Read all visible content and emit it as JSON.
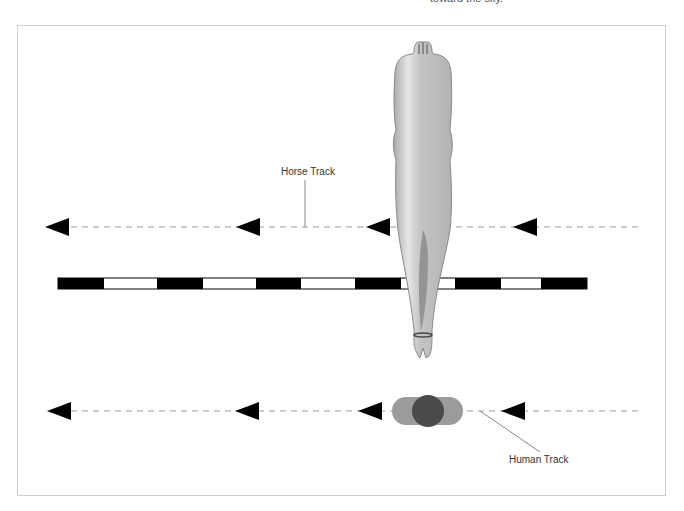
{
  "caption_fragment": "toward the sky.",
  "labels": {
    "horse_track": "Horse Track",
    "human_track": "Human Track"
  },
  "colors": {
    "frame": "#cfcfcf",
    "arrow": "#000000",
    "dash": "#999999",
    "scale_black": "#000000",
    "scale_white": "#ffffff",
    "horse_body": "#b9b9b9",
    "human_body": "#999999",
    "human_head": "#4a4a4a"
  },
  "horse_track": {
    "y": 227,
    "arrows_x": [
      45,
      236,
      368,
      513
    ]
  },
  "human_track": {
    "y": 411,
    "arrows_x": [
      47,
      235,
      358,
      501
    ]
  },
  "scale_bar": {
    "y": 278,
    "height": 11,
    "segments": [
      {
        "x": 58,
        "w": 46,
        "color": "black"
      },
      {
        "x": 104,
        "w": 53,
        "color": "white"
      },
      {
        "x": 157,
        "w": 46,
        "color": "black"
      },
      {
        "x": 203,
        "w": 53,
        "color": "white"
      },
      {
        "x": 256,
        "w": 45,
        "color": "black"
      },
      {
        "x": 301,
        "w": 54,
        "color": "white"
      },
      {
        "x": 355,
        "w": 46,
        "color": "black"
      },
      {
        "x": 401,
        "w": 54,
        "color": "white"
      },
      {
        "x": 455,
        "w": 46,
        "color": "black"
      },
      {
        "x": 501,
        "w": 40,
        "color": "white"
      },
      {
        "x": 541,
        "w": 46,
        "color": "black"
      }
    ]
  }
}
